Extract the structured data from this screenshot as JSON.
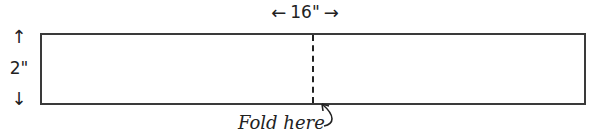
{
  "diagram": {
    "width_label": "16\"",
    "height_label": "2\"",
    "fold_label": "Fold here",
    "arrows": {
      "left": "←",
      "right": "→",
      "up": "↑",
      "down": "↓"
    },
    "line_color": "#3a3a3a"
  }
}
